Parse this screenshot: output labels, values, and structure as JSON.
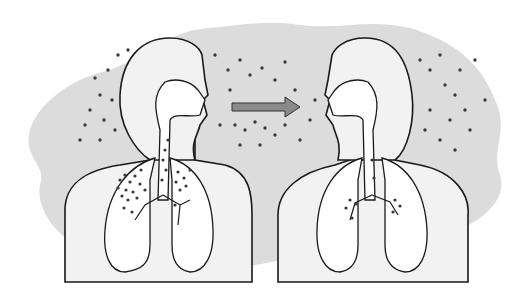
{
  "figure": {
    "colors": {
      "background": "#ffffff",
      "cloud": "#dcdcdc",
      "body_fill": "#f2f2f2",
      "lung_fill": "#ffffff",
      "outline": "#1a1a1a",
      "particle": "#3a3a3a",
      "arrow_fill": "#8a8a8a",
      "arrow_stroke": "#333333"
    },
    "arrow": {
      "direction": "right",
      "from_x": 232,
      "to_x": 300,
      "y": 107
    },
    "figures": [
      {
        "id": "left",
        "label": "",
        "deposition": "heavy"
      },
      {
        "id": "right",
        "label": "",
        "deposition": "light"
      }
    ]
  }
}
